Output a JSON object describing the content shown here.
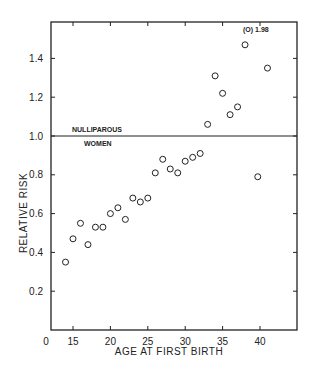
{
  "chart_data": {
    "type": "scatter",
    "title": "",
    "xlabel": "AGE AT FIRST BIRTH",
    "ylabel": "RELATIVE RISK",
    "xlim": [
      12,
      45
    ],
    "ylim": [
      0,
      1.6
    ],
    "x_ticks": [
      15,
      20,
      25,
      30,
      35,
      40
    ],
    "x_tick_labels": [
      "0",
      "15",
      "20",
      "25",
      "30",
      "35",
      "40"
    ],
    "y_ticks": [
      0.2,
      0.4,
      0.6,
      0.8,
      1.0,
      1.2,
      1.4
    ],
    "y_tick_labels": [
      "0.2",
      "0.4",
      "0.6",
      "0.8",
      "1.0",
      "1.2",
      "1.4"
    ],
    "grid": false,
    "marker": "open-circle",
    "series": [
      {
        "name": "Relative risk by age at first birth",
        "x": [
          14,
          15,
          16,
          17,
          18,
          19,
          20,
          21,
          22,
          23,
          24,
          25,
          26,
          27,
          28,
          29,
          30,
          31,
          32,
          33,
          34,
          35,
          36,
          37,
          38,
          39.7,
          41
        ],
        "y": [
          0.35,
          0.47,
          0.55,
          0.44,
          0.53,
          0.53,
          0.6,
          0.63,
          0.57,
          0.68,
          0.66,
          0.68,
          0.81,
          0.88,
          0.83,
          0.81,
          0.87,
          0.89,
          0.91,
          1.06,
          1.31,
          1.22,
          1.11,
          1.15,
          1.47,
          0.79,
          1.35
        ]
      }
    ],
    "reference_line": {
      "y": 1.0,
      "label_above": "NULLIPAROUS",
      "label_below": "WOMEN"
    },
    "annotations": [
      {
        "text": "(O) 1.98",
        "note": "off-scale point",
        "x": 39,
        "y": 1.98
      }
    ]
  }
}
